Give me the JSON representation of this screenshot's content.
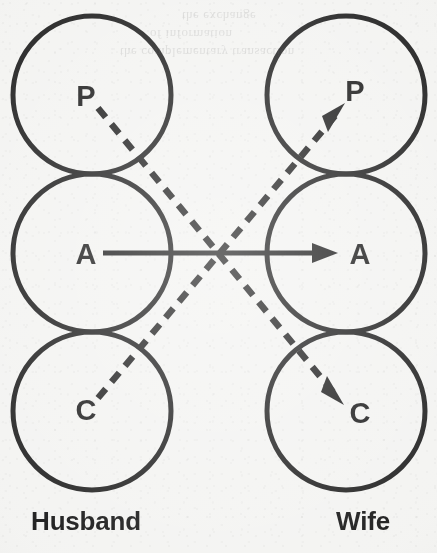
{
  "figure": {
    "background_color": "#f3f3f1",
    "ink_color": "#1e1e1e"
  },
  "people": [
    {
      "id": "husband",
      "label": "Husband",
      "side": "left"
    },
    {
      "id": "wife",
      "label": "Wife",
      "side": "right"
    }
  ],
  "ego_states": {
    "parent": {
      "letter": "P",
      "name": "Parent"
    },
    "adult": {
      "letter": "A",
      "name": "Adult"
    },
    "child": {
      "letter": "C",
      "name": "Child"
    }
  },
  "columns": {
    "husband": {
      "parent_letter": "P",
      "adult_letter": "A",
      "child_letter": "C"
    },
    "wife": {
      "parent_letter": "P",
      "adult_letter": "A",
      "child_letter": "C"
    }
  },
  "transactions": [
    {
      "id": "adult-to-adult",
      "style": "solid",
      "from": "husband.adult",
      "to": "wife.adult",
      "arrow": "single",
      "direction": "left-to-right"
    },
    {
      "id": "parent-to-child",
      "style": "dashed",
      "from": "husband.parent",
      "to": "wife.child",
      "arrow": "single",
      "direction": "down-right"
    },
    {
      "id": "child-to-parent",
      "style": "dashed",
      "from": "husband.child",
      "to": "wife.parent",
      "arrow": "single",
      "direction": "up-right"
    }
  ],
  "ghost_text": [
    {
      "text": "the exchange",
      "x": 182,
      "y": 8
    },
    {
      "text": "of information",
      "x": 150,
      "y": 26
    },
    {
      "text": "the complementary transaction",
      "x": 120,
      "y": 44
    }
  ]
}
